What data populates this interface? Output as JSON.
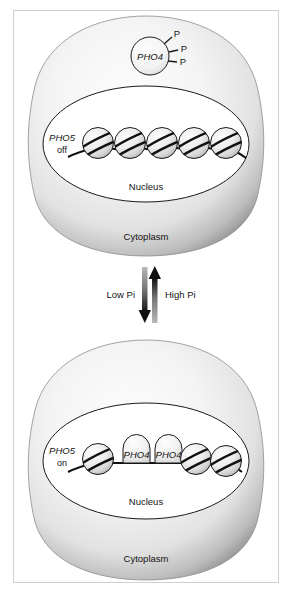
{
  "figure": {
    "cells": [
      {
        "id": "cell-top",
        "state": "off",
        "cytoplasm_label": "Cytoplasm",
        "nucleus_label": "Nucleus",
        "gene_label_italic": "PHO5",
        "gene_label_state": "off",
        "factor": {
          "name": "PHO4",
          "location": "cytoplasm",
          "phosphates": [
            "P",
            "P",
            "P"
          ]
        },
        "nucleosome_count": 5,
        "bound_factors": []
      },
      {
        "id": "cell-bottom",
        "state": "on",
        "cytoplasm_label": "Cytoplasm",
        "nucleus_label": "Nucleus",
        "gene_label_italic": "PHO5",
        "gene_label_state": "on",
        "factor": null,
        "nucleosome_count": 3,
        "bound_factors": [
          "PHO4",
          "PHO4"
        ]
      }
    ],
    "transition": {
      "down_arrow_label": "Low Pi",
      "up_arrow_label": "High Pi"
    },
    "colors": {
      "cell_rim": "#8d8d8d",
      "cell_fill": "#f2f2f2",
      "nucleus_fill": "#ffffff",
      "outline": "#1a1a1a",
      "arrow_dark": "#111111",
      "arrow_gray": "#9a9a9a",
      "frame_border": "#cfcfcf"
    }
  }
}
